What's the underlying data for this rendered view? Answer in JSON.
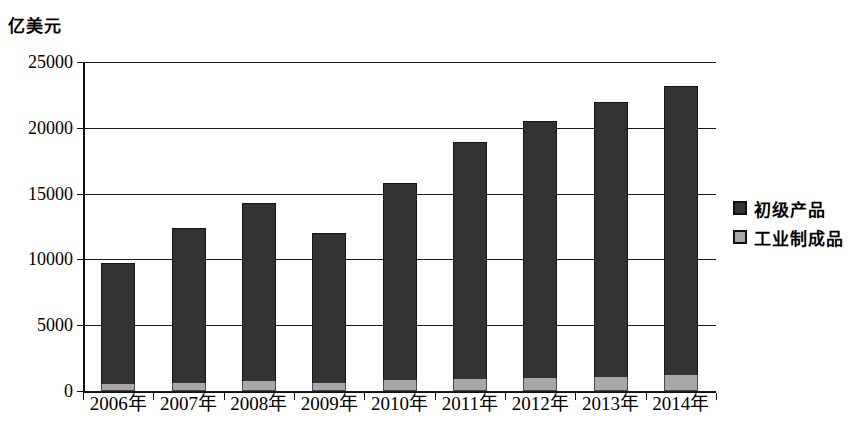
{
  "chart_data": {
    "type": "bar",
    "stacked": true,
    "title": "",
    "subtitle": "",
    "xlabel": "",
    "ylabel": "亿美元",
    "unit_caption": "亿美元",
    "categories": [
      "2006年",
      "2007年",
      "2008年",
      "2009年",
      "2010年",
      "2011年",
      "2012年",
      "2013年",
      "2014年"
    ],
    "series": [
      {
        "name": "初级产品",
        "color": "#333333",
        "values": [
          9250,
          11750,
          13500,
          11400,
          14950,
          18000,
          19500,
          20900,
          22000
        ]
      },
      {
        "name": "工业制成品",
        "color": "#a8a8a8",
        "values": [
          500,
          600,
          750,
          600,
          850,
          900,
          1000,
          1050,
          1200
        ]
      }
    ],
    "totals": [
      9750,
      12350,
      14250,
      12000,
      15800,
      18900,
      20500,
      21950,
      23200
    ],
    "ylim": [
      0,
      25000
    ],
    "yticks": [
      0,
      5000,
      10000,
      15000,
      20000,
      25000
    ],
    "ytick_labels": [
      "0",
      "5000",
      "10000",
      "15000",
      "20000",
      "25000"
    ],
    "grid": true,
    "legend_position": "right"
  },
  "legend": {
    "items": [
      {
        "label": "初级产品",
        "color": "#333333"
      },
      {
        "label": "工业制成品",
        "color": "#a8a8a8"
      }
    ]
  }
}
